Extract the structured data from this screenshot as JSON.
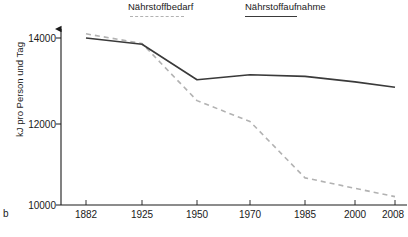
{
  "figure_label": "b",
  "legend": {
    "position": "top",
    "entries": [
      {
        "label": "Nährstoffbedarf",
        "style": "dashed",
        "color": "#b2b2b2"
      },
      {
        "label": "Nährstoffaufnahme",
        "style": "solid",
        "color": "#3a3a3a"
      }
    ]
  },
  "axis": {
    "ylabel": "kJ pro Person und Tag",
    "yticks": [
      "14000",
      "12000",
      "10000"
    ],
    "xticks": [
      "1882",
      "1925",
      "1950",
      "1970",
      "1985",
      "2000",
      "2008"
    ]
  },
  "chart_data": {
    "type": "line",
    "title": "",
    "xlabel": "",
    "ylabel": "kJ pro Person und Tag",
    "categories": [
      "1882",
      "1925",
      "1950",
      "1970",
      "1985",
      "2000",
      "2008"
    ],
    "x": [
      1882,
      1925,
      1950,
      1970,
      1985,
      2000,
      2008
    ],
    "ylim": [
      10000,
      14000
    ],
    "yticks": [
      10000,
      12000,
      14000
    ],
    "grid": false,
    "legend_position": "top",
    "series": [
      {
        "name": "Nährstoffbedarf",
        "style": "dashed",
        "color": "#b2b2b2",
        "values": [
          14100,
          13870,
          12500,
          12000,
          10650,
          10400,
          10200
        ]
      },
      {
        "name": "Nährstoffaufnahme",
        "style": "solid",
        "color": "#3a3a3a",
        "values": [
          14000,
          13850,
          13000,
          13120,
          13080,
          12950,
          12820
        ]
      }
    ]
  }
}
